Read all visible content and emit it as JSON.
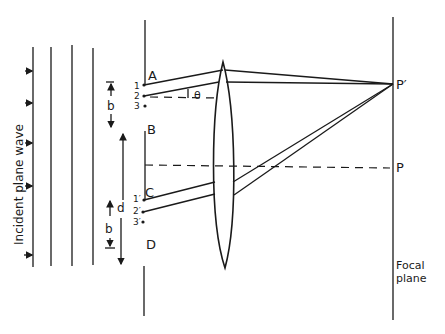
{
  "diagram": {
    "labels": {
      "incident": "Incident plane wave",
      "A": "A",
      "B": "B",
      "C": "C",
      "D": "D",
      "b_top": "b",
      "b_bottom": "b",
      "d": "d",
      "theta": "θ",
      "p_prime": "P′",
      "p": "P",
      "focal_line1": "Focal",
      "focal_line2": "plane",
      "pt1": "1",
      "pt2": "2",
      "pt3": "3",
      "pt1p": "1′",
      "pt2p": "2′",
      "pt3p": "3′"
    },
    "colors": {
      "ink": "#1a1a1a",
      "background": "#ffffff"
    }
  }
}
